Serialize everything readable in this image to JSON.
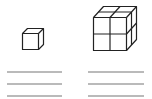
{
  "figure": {
    "items": [
      {
        "label": "small-cube",
        "units": 1,
        "answer_lines": 3
      },
      {
        "label": "large-cube",
        "units": 8,
        "grid": "2x2x2",
        "answer_lines": 3
      }
    ],
    "colors": {
      "stroke": "#222222",
      "line": "#777777",
      "background": "#ffffff"
    }
  }
}
